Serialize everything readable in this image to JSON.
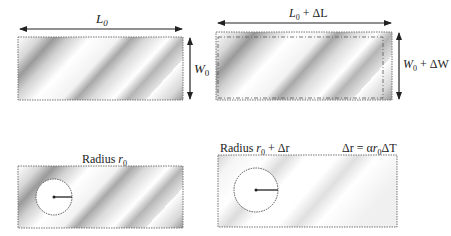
{
  "figure": {
    "panels": [
      {
        "id": "original-plate",
        "length_label_main": "L",
        "length_label_sub": "0",
        "width_label_main": "W",
        "width_label_sub": "0"
      },
      {
        "id": "expanded-plate",
        "length_label_main": "L",
        "length_label_sub": "0",
        "length_label_suffix": " + ΔL",
        "width_label_main": "W",
        "width_label_sub": "0",
        "width_label_suffix": " + ΔW"
      },
      {
        "id": "original-hole",
        "radius_label_prefix": "Radius ",
        "radius_label_main": "r",
        "radius_label_sub": "0"
      },
      {
        "id": "expanded-hole",
        "radius_label_prefix": "Radius ",
        "radius_label_main": "r",
        "radius_label_sub": "0",
        "radius_label_suffix": " + Δr",
        "formula_lhs": "Δr = α",
        "formula_r": "r",
        "formula_sub": "0",
        "formula_rhs": "ΔT"
      }
    ]
  }
}
